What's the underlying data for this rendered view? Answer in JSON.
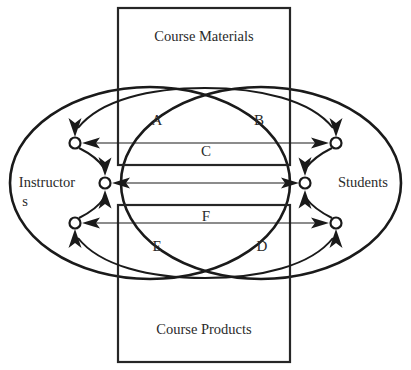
{
  "diagram": {
    "boxes": [
      {
        "id": "course-materials",
        "label": "Course Materials",
        "x": 118,
        "y": 8,
        "width": 172,
        "height": 157,
        "label_x": 204,
        "label_y": 41
      },
      {
        "id": "course-products",
        "label": "Course Products",
        "x": 118,
        "y": 205,
        "width": 172,
        "height": 157,
        "label_x": 204,
        "label_y": 334
      }
    ],
    "groups": [
      {
        "id": "instructors",
        "label_line1": "Instructor",
        "label_line2": "s",
        "cx": 150,
        "cy": 183,
        "rx": 140,
        "ry": 96,
        "label_x": 47,
        "label_y": 187
      },
      {
        "id": "students",
        "label": "Students",
        "cx": 261,
        "cy": 183,
        "rx": 140,
        "ry": 96,
        "label_x": 363,
        "label_y": 187
      }
    ],
    "region_labels": [
      {
        "id": "region-a",
        "text": "A",
        "x": 157,
        "y": 125
      },
      {
        "id": "region-b",
        "text": "B",
        "x": 259,
        "y": 125
      },
      {
        "id": "region-c",
        "text": "C",
        "x": 206,
        "y": 156
      },
      {
        "id": "region-f",
        "text": "F",
        "x": 206,
        "y": 221
      },
      {
        "id": "region-e",
        "text": "E",
        "x": 157,
        "y": 251
      },
      {
        "id": "region-d",
        "text": "D",
        "x": 262,
        "y": 251
      }
    ],
    "nodes": [
      {
        "id": "node-instructor-top",
        "cx": 75,
        "cy": 143,
        "r": 5.5
      },
      {
        "id": "node-instructor-middle",
        "cx": 105,
        "cy": 183,
        "r": 5.5
      },
      {
        "id": "node-instructor-bottom",
        "cx": 75,
        "cy": 223,
        "r": 5.5
      },
      {
        "id": "node-student-top",
        "cx": 336,
        "cy": 143,
        "r": 5.5
      },
      {
        "id": "node-student-middle",
        "cx": 305,
        "cy": 183,
        "r": 5.5
      },
      {
        "id": "node-student-bottom",
        "cx": 336,
        "cy": 223,
        "r": 5.5
      }
    ],
    "connections": [
      {
        "id": "link-top-horizontal",
        "from": "node-instructor-top",
        "to": "node-student-top",
        "kind": "bidirectional-straight",
        "y": 143
      },
      {
        "id": "link-middle-horizontal",
        "from": "node-instructor-middle",
        "to": "node-student-middle",
        "kind": "bidirectional-straight",
        "y": 183
      },
      {
        "id": "link-bottom-horizontal",
        "from": "node-instructor-bottom",
        "to": "node-student-bottom",
        "kind": "bidirectional-straight",
        "y": 223
      },
      {
        "id": "arc-instructor-top-to-middle",
        "kind": "curved-arrow",
        "direction": "down"
      },
      {
        "id": "arc-instructor-bottom-to-middle",
        "kind": "curved-arrow",
        "direction": "up"
      },
      {
        "id": "arc-student-top-to-middle",
        "kind": "curved-arrow",
        "direction": "down"
      },
      {
        "id": "arc-student-bottom-to-middle",
        "kind": "curved-arrow",
        "direction": "up"
      },
      {
        "id": "arc-materials-to-instructor-top",
        "kind": "curved-arrow",
        "direction": "down"
      },
      {
        "id": "arc-materials-to-student-top",
        "kind": "curved-arrow",
        "direction": "down"
      },
      {
        "id": "arc-instructor-bottom-to-products",
        "kind": "curved-arrow",
        "direction": "up"
      },
      {
        "id": "arc-student-bottom-to-products",
        "kind": "curved-arrow",
        "direction": "up"
      }
    ],
    "colors": {
      "stroke": "#1a1a1a",
      "box_stroke": "#262626",
      "text": "#2a2a2a",
      "background": "#ffffff",
      "node_fill": "#ffffff"
    }
  }
}
